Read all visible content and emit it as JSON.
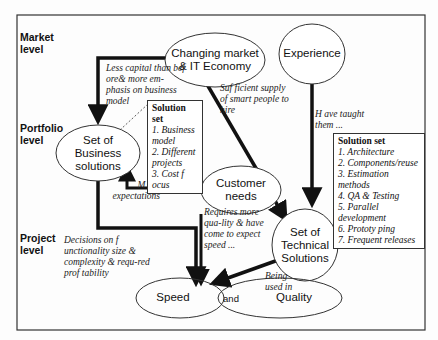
{
  "levels": {
    "market": "Market level",
    "portfolio": "Portfolio level",
    "project": "Project level"
  },
  "nodes": {
    "changing_market": "Changing market & IT Economy",
    "experience": "Experience",
    "business_solutions": "Set of Business solutions",
    "customer_needs": "Customer needs",
    "technical_solutions": "Set of Technical Solutions",
    "speed": "Speed",
    "and": "and",
    "quality": "Quality"
  },
  "edge_labels": {
    "less_capital": "Less capital than bef ore& more em-phasis on business model",
    "sufficient_supply": "Suf ficient supply of smart people to hire",
    "have_taught": "H ave taught them ...",
    "more_expectations": "M ore expectations",
    "requires_quality": "Requires more qua-lity & have come to expect speed ...",
    "decisions": "Decisions on f unctionality size & complexity & requ-red prof tability",
    "being_used": "Being used in"
  },
  "business_solution_set": {
    "title": "Solution set",
    "items": [
      "1. Business model",
      "2. Different projects",
      "3. Cost f ocus"
    ]
  },
  "technical_solution_set": {
    "title": "Solution set",
    "items": [
      "1. Architecture",
      "2. Components/reuse",
      "3. Estimation methods",
      "4. QA & Testing",
      "5. Parallel development",
      "6. Prototy ping",
      "7. Frequent releases"
    ]
  },
  "colors": {
    "stroke": "#111111",
    "frame": "#333333",
    "background": "#fdfdfd"
  }
}
